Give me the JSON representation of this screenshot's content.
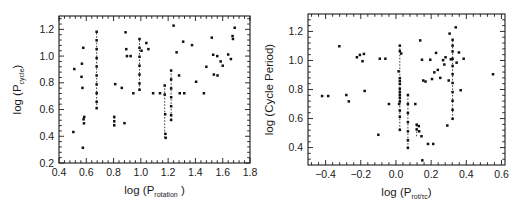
{
  "figure": {
    "background": "#ffffff",
    "point_color": "#111111",
    "axis_color": "#1a1a1a",
    "link_color": "#2b2b2b"
  },
  "chart_data": [
    {
      "type": "scatter",
      "panel": "left",
      "title": "",
      "xlabel": "log (P",
      "xlabel_sub": "rotation",
      "xlabel_tail": " )",
      "ylabel": "log (P",
      "ylabel_sub": "cycle",
      "ylabel_tail": ")",
      "xlim": [
        0.4,
        1.8
      ],
      "ylim": [
        0.2,
        1.3
      ],
      "grid": false,
      "legend": "none",
      "xticks": [
        0.4,
        0.6,
        0.8,
        1.0,
        1.2,
        1.4,
        1.6,
        1.8
      ],
      "xticklabels": [
        "0.4",
        "0.6",
        "0.8",
        "1.0",
        "1.2",
        "1.4",
        "1.6",
        "1.8"
      ],
      "yticks": [
        0.2,
        0.4,
        0.6,
        0.8,
        1.0,
        1.2
      ],
      "yticklabels": [
        "0.2",
        "0.4",
        "0.6",
        "0.8",
        "1.0",
        "1.2"
      ],
      "x_minor_per_major": 4,
      "y_minor_per_major": 4,
      "points": [
        [
          0.505,
          0.432
        ],
        [
          0.512,
          0.903
        ],
        [
          0.565,
          0.845
        ],
        [
          0.568,
          0.943
        ],
        [
          0.572,
          0.762
        ],
        [
          0.575,
          0.314
        ],
        [
          0.578,
          1.062
        ],
        [
          0.58,
          0.527
        ],
        [
          0.583,
          0.497
        ],
        [
          0.585,
          0.545
        ],
        [
          0.676,
          1.182
        ],
        [
          0.676,
          1.118
        ],
        [
          0.676,
          1.052
        ],
        [
          0.676,
          0.985
        ],
        [
          0.676,
          0.922
        ],
        [
          0.676,
          0.855
        ],
        [
          0.676,
          0.788
        ],
        [
          0.676,
          0.722
        ],
        [
          0.676,
          0.658
        ],
        [
          0.676,
          0.61
        ],
        [
          0.805,
          0.545
        ],
        [
          0.805,
          0.512
        ],
        [
          0.805,
          0.482
        ],
        [
          0.812,
          0.79
        ],
        [
          0.86,
          0.762
        ],
        [
          0.88,
          0.498
        ],
        [
          0.888,
          1.178
        ],
        [
          0.893,
          1.052
        ],
        [
          0.898,
          1.0
        ],
        [
          0.925,
          1.0
        ],
        [
          0.945,
          0.722
        ],
        [
          0.99,
          1.128
        ],
        [
          0.99,
          1.062
        ],
        [
          0.99,
          0.995
        ],
        [
          0.99,
          0.928
        ],
        [
          0.99,
          0.862
        ],
        [
          0.99,
          0.795
        ],
        [
          0.99,
          0.748
        ],
        [
          1.005,
          1.04
        ],
        [
          1.04,
          1.098
        ],
        [
          1.055,
          1.052
        ],
        [
          1.09,
          0.722
        ],
        [
          1.14,
          0.722
        ],
        [
          1.175,
          0.78
        ],
        [
          1.175,
          0.712
        ],
        [
          1.178,
          0.565
        ],
        [
          1.18,
          0.418
        ],
        [
          1.182,
          0.388
        ],
        [
          1.222,
          0.892
        ],
        [
          1.222,
          0.825
        ],
        [
          1.222,
          0.758
        ],
        [
          1.222,
          0.692
        ],
        [
          1.222,
          0.625
        ],
        [
          1.222,
          0.558
        ],
        [
          1.222,
          0.522
        ],
        [
          1.24,
          1.228
        ],
        [
          1.262,
          1.028
        ],
        [
          1.28,
          0.855
        ],
        [
          1.285,
          0.722
        ],
        [
          1.31,
          1.108
        ],
        [
          1.318,
          0.722
        ],
        [
          1.375,
          1.082
        ],
        [
          1.405,
          0.808
        ],
        [
          1.462,
          0.722
        ],
        [
          1.48,
          0.92
        ],
        [
          1.52,
          1.138
        ],
        [
          1.53,
          1.01
        ],
        [
          1.535,
          0.862
        ],
        [
          1.56,
          1.0
        ],
        [
          1.562,
          0.855
        ],
        [
          1.585,
          0.96
        ],
        [
          1.6,
          0.928
        ],
        [
          1.64,
          1.012
        ],
        [
          1.66,
          0.978
        ],
        [
          1.672,
          1.15
        ],
        [
          1.675,
          1.128
        ],
        [
          1.688,
          1.212
        ]
      ],
      "links": [
        [
          0.676,
          0.61,
          1.182
        ],
        [
          0.805,
          0.482,
          0.545
        ],
        [
          0.99,
          0.748,
          1.128
        ],
        [
          1.175,
          0.388,
          0.78
        ],
        [
          1.222,
          0.522,
          0.892
        ]
      ]
    },
    {
      "type": "scatter",
      "panel": "right",
      "title": "",
      "xlabel": "log (P",
      "xlabel_sub": "rot",
      "xlabel_mid": "/",
      "xlabel_sub2": "τ",
      "xlabel_sub3": "c",
      "xlabel_tail": ")",
      "ylabel": "log (Cycle Period)",
      "xlim": [
        -0.5,
        0.62
      ],
      "ylim": [
        0.28,
        1.32
      ],
      "grid": false,
      "legend": "none",
      "xticks": [
        -0.4,
        -0.2,
        0.0,
        0.2,
        0.4,
        0.6
      ],
      "xticklabels": [
        "−0.4",
        "−0.2",
        "0.0",
        "0.2",
        "0.4",
        "0.6"
      ],
      "yticks": [
        0.4,
        0.6,
        0.8,
        1.0,
        1.2
      ],
      "yticklabels": [
        "0.4",
        "0.6",
        "0.8",
        "1.0",
        "1.2"
      ],
      "x_minor_per_major": 4,
      "y_minor_per_major": 4,
      "points": [
        [
          -0.42,
          0.755
        ],
        [
          -0.385,
          0.755
        ],
        [
          -0.322,
          1.098
        ],
        [
          -0.282,
          0.762
        ],
        [
          -0.268,
          0.718
        ],
        [
          -0.222,
          1.022
        ],
        [
          -0.205,
          1.038
        ],
        [
          -0.19,
          0.995
        ],
        [
          -0.182,
          1.045
        ],
        [
          -0.178,
          0.79
        ],
        [
          -0.1,
          0.488
        ],
        [
          -0.092,
          1.012
        ],
        [
          -0.06,
          1.012
        ],
        [
          -0.04,
          0.7
        ],
        [
          0.015,
          0.925
        ],
        [
          0.018,
          0.7
        ],
        [
          0.022,
          1.102
        ],
        [
          0.022,
          1.065
        ],
        [
          0.022,
          0.878
        ],
        [
          0.022,
          0.858
        ],
        [
          0.022,
          0.838
        ],
        [
          0.022,
          0.805
        ],
        [
          0.022,
          0.782
        ],
        [
          0.022,
          0.762
        ],
        [
          0.022,
          0.742
        ],
        [
          0.022,
          0.718
        ],
        [
          0.022,
          0.655
        ],
        [
          0.022,
          0.612
        ],
        [
          0.022,
          0.522
        ],
        [
          0.03,
          1.048
        ],
        [
          0.068,
          0.762
        ],
        [
          0.068,
          0.7
        ],
        [
          0.068,
          0.638
        ],
        [
          0.068,
          0.575
        ],
        [
          0.068,
          0.512
        ],
        [
          0.068,
          0.45
        ],
        [
          0.068,
          0.398
        ],
        [
          0.11,
          0.7
        ],
        [
          0.118,
          0.558
        ],
        [
          0.118,
          0.525
        ],
        [
          0.13,
          0.548
        ],
        [
          0.132,
          0.512
        ],
        [
          0.138,
          1.138
        ],
        [
          0.145,
          0.478
        ],
        [
          0.148,
          1.005
        ],
        [
          0.15,
          0.312
        ],
        [
          0.155,
          0.862
        ],
        [
          0.168,
          0.855
        ],
        [
          0.182,
          0.425
        ],
        [
          0.195,
          1.005
        ],
        [
          0.205,
          0.872
        ],
        [
          0.212,
          0.425
        ],
        [
          0.218,
          0.918
        ],
        [
          0.228,
          1.052
        ],
        [
          0.238,
          0.935
        ],
        [
          0.252,
          0.88
        ],
        [
          0.268,
          1.002
        ],
        [
          0.275,
          0.972
        ],
        [
          0.282,
          1.022
        ],
        [
          0.292,
          0.552
        ],
        [
          0.3,
          0.862
        ],
        [
          0.305,
          1.185
        ],
        [
          0.312,
          1.008
        ],
        [
          0.322,
          1.142
        ],
        [
          0.322,
          1.102
        ],
        [
          0.322,
          1.062
        ],
        [
          0.322,
          1.012
        ],
        [
          0.322,
          0.962
        ],
        [
          0.322,
          0.905
        ],
        [
          0.322,
          0.845
        ],
        [
          0.322,
          0.782
        ],
        [
          0.322,
          0.722
        ],
        [
          0.322,
          0.66
        ],
        [
          0.322,
          0.598
        ],
        [
          0.34,
          1.228
        ],
        [
          0.345,
          0.985
        ],
        [
          0.358,
          1.055
        ],
        [
          0.368,
          0.795
        ],
        [
          0.385,
          1.012
        ],
        [
          0.552,
          0.905
        ]
      ],
      "links": [
        [
          0.022,
          0.522,
          1.102
        ],
        [
          0.068,
          0.398,
          0.762
        ],
        [
          0.118,
          0.478,
          0.558
        ],
        [
          0.322,
          0.598,
          1.142
        ]
      ]
    }
  ]
}
